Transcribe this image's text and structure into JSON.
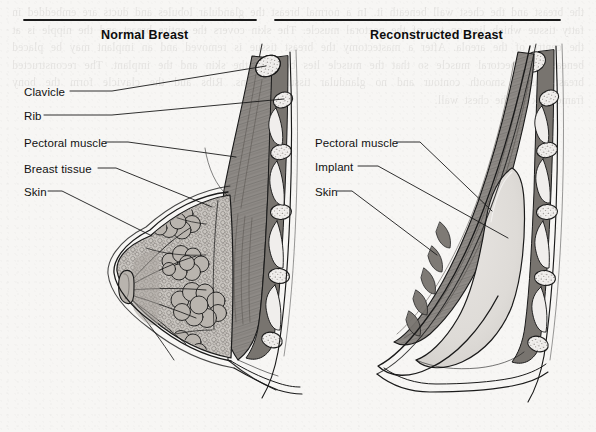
{
  "figure": {
    "background_color": "#f7f6f4",
    "ink_color": "#1a1a1a",
    "bleed_text": "the breast and the chest wall beneath it. In a normal breast the glandular lobules and ducts are embedded in fatty tissue which lies on top of the pectoral muscle. The skin covers the entire breast and the nipple is at the centre of the areola. After a mastectomy the breast tissue is removed and an implant may be placed beneath the pectoral muscle so that the muscle lies between the skin and the implant. The reconstructed breast has a smooth contour and no glandular tissue remains. Ribs and the clavicle form the bony framework of the chest wall."
  },
  "panels": [
    {
      "id": "normal",
      "title": "Normal Breast",
      "rule": {
        "x1": 24,
        "x2": 256,
        "y": 20
      },
      "title_pos": {
        "x": 101,
        "y": 28
      },
      "labels": [
        {
          "name": "clavicle",
          "text": "Clavicle",
          "x": 24,
          "y": 86,
          "leader": [
            [
              70,
              91
            ],
            [
              112,
              91
            ],
            [
              266,
              66
            ]
          ]
        },
        {
          "name": "rib",
          "text": "Rib",
          "x": 24,
          "y": 110,
          "leader": [
            [
              44,
              115
            ],
            [
              112,
              115
            ],
            [
              284,
              99
            ]
          ]
        },
        {
          "name": "pectoral-muscle",
          "text": "Pectoral muscle",
          "x": 24,
          "y": 137,
          "leader": [
            [
              106,
              142
            ],
            [
              128,
              142
            ],
            [
              236,
              157
            ]
          ]
        },
        {
          "name": "breast-tissue",
          "text": "Breast tissue",
          "x": 24,
          "y": 163,
          "leader": [
            [
              98,
              168
            ],
            [
              116,
              168
            ],
            [
              212,
              207
            ]
          ]
        },
        {
          "name": "skin",
          "text": "Skin",
          "x": 24,
          "y": 186,
          "leader": [
            [
              48,
              191
            ],
            [
              62,
              191
            ],
            [
              152,
              236
            ]
          ]
        }
      ]
    },
    {
      "id": "reconstructed",
      "title": "Reconstructed Breast",
      "rule": {
        "x1": 275,
        "x2": 560,
        "y": 20
      },
      "title_pos": {
        "x": 370,
        "y": 28
      },
      "labels": [
        {
          "name": "pectoral-muscle",
          "text": "Pectoral muscle",
          "x": 315,
          "y": 137,
          "leader": [
            [
              397,
              142
            ],
            [
              420,
              142
            ],
            [
              492,
              211
            ]
          ]
        },
        {
          "name": "implant",
          "text": "Implant",
          "x": 315,
          "y": 161,
          "leader": [
            [
              358,
              166
            ],
            [
              378,
              166
            ],
            [
              508,
              238
            ]
          ]
        },
        {
          "name": "skin",
          "text": "Skin",
          "x": 315,
          "y": 186,
          "leader": [
            [
              337,
              191
            ],
            [
              352,
              191
            ],
            [
              437,
              255
            ]
          ]
        }
      ]
    }
  ],
  "anatomy": {
    "colors": {
      "skin_fill": "#f2f0ee",
      "fat_fill": "#c9c5c0",
      "gland_fill": "#b9b4ae",
      "muscle_fill": "#8e8a86",
      "muscle_dark": "#78746f",
      "bone_fill": "#f3f1ef",
      "implant_fill": "#dedbd7",
      "outline": "#1a1a1a"
    },
    "structures": [
      "clavicle",
      "ribs",
      "pectoral-muscle",
      "breast-fat",
      "glandular-lobules",
      "ducts",
      "nipple",
      "skin",
      "implant"
    ],
    "rib_count_normal": 4,
    "rib_count_reconstructed": 4,
    "lobule_count": 4
  }
}
